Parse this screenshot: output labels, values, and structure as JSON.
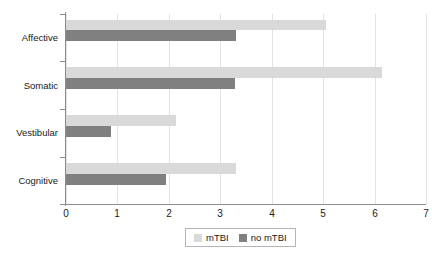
{
  "chart_data": {
    "type": "bar",
    "orientation": "horizontal",
    "title": "",
    "xlabel": "",
    "ylabel": "",
    "categories": [
      "Affective",
      "Somatic",
      "Vestibular",
      "Cognitive"
    ],
    "series": [
      {
        "name": "mTBI",
        "color": "#d9d9d9",
        "values": [
          5.05,
          6.15,
          2.14,
          3.3
        ]
      },
      {
        "name": "no mTBI",
        "color": "#808080",
        "values": [
          3.3,
          3.28,
          0.87,
          1.94
        ]
      }
    ],
    "xlim": [
      0,
      7
    ],
    "xticks": [
      0,
      1,
      2,
      3,
      4,
      5,
      6,
      7
    ],
    "xtick_labels": [
      "0",
      "1",
      "2",
      "3",
      "4",
      "5",
      "6",
      "7"
    ],
    "grid": "vertical",
    "legend_position": "bottom-center",
    "legend_entries": [
      "mTBI",
      "no mTBI"
    ],
    "axis_color": "#8d8d8d",
    "grid_color": "#e3e3e3"
  }
}
